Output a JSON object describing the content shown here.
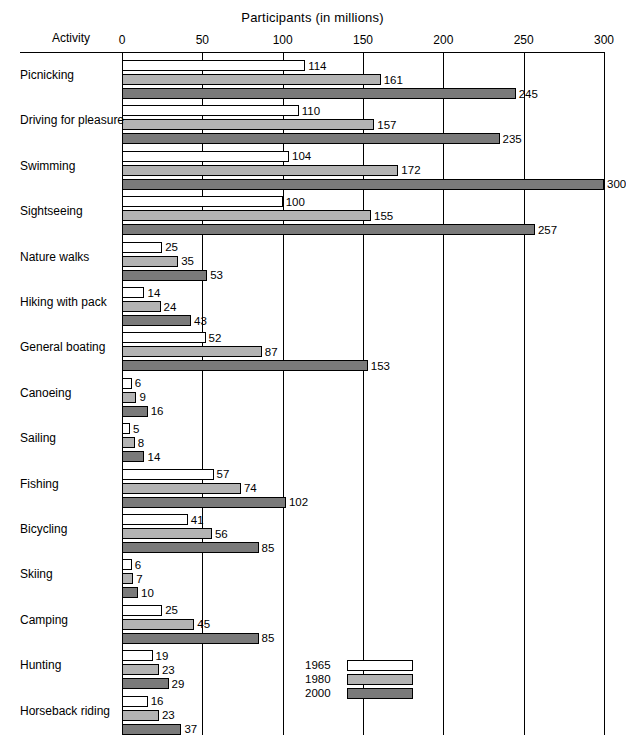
{
  "chart_data": {
    "type": "bar",
    "title": "Participants (in millions)",
    "xlabel": "Participants (in millions)",
    "ylabel": "Activity",
    "orientation": "horizontal",
    "xlim": [
      0,
      300
    ],
    "xticks": [
      "0",
      "50",
      "100",
      "150",
      "200",
      "250",
      "300"
    ],
    "grid": true,
    "legend_position": "inside-bottom-right",
    "categories": [
      "Picnicking",
      "Driving for pleasure",
      "Swimming",
      "Sightseeing",
      "Nature walks",
      "Hiking with pack",
      "General boating",
      "Canoeing",
      "Sailing",
      "Fishing",
      "Bicycling",
      "Skiing",
      "Camping",
      "Hunting",
      "Horseback riding"
    ],
    "series": [
      {
        "name": "1965",
        "color": "#ffffff",
        "values": [
          114,
          110,
          104,
          100,
          25,
          14,
          52,
          6,
          5,
          57,
          41,
          6,
          25,
          19,
          16
        ]
      },
      {
        "name": "1980",
        "color": "#b3b3b3",
        "values": [
          161,
          157,
          172,
          155,
          35,
          24,
          87,
          9,
          8,
          74,
          56,
          7,
          45,
          23,
          23
        ]
      },
      {
        "name": "2000",
        "color": "#7a7a7a",
        "values": [
          245,
          235,
          300,
          257,
          53,
          43,
          153,
          16,
          14,
          102,
          85,
          10,
          85,
          29,
          37
        ]
      }
    ]
  },
  "axis_label_activity": "Activity"
}
